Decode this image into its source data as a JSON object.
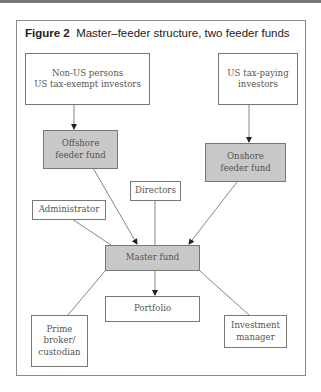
{
  "figure": {
    "label": "Figure 2",
    "title": "Master–feeder structure, two feeder funds"
  },
  "nodes": {
    "non_us": {
      "text": "Non-US persons\nUS tax-exempt investors",
      "shaded": false
    },
    "us_taxpaying": {
      "text": "US tax-paying\ninvestors",
      "shaded": false
    },
    "offshore": {
      "text": "Offshore\nfeeder fund",
      "shaded": true
    },
    "onshore": {
      "text": "Onshore\nfeeder fund",
      "shaded": true
    },
    "directors": {
      "text": "Directors",
      "shaded": false
    },
    "administrator": {
      "text": "Administrator",
      "shaded": false
    },
    "master": {
      "text": "Master fund",
      "shaded": true
    },
    "portfolio": {
      "text": "Portfolio",
      "shaded": false
    },
    "prime_broker": {
      "text": "Prime\nbroker/\ncustodian",
      "shaded": false
    },
    "investment_manager": {
      "text": "Investment\nmanager",
      "shaded": false
    }
  },
  "edges": [
    {
      "from": "non_us",
      "to": "offshore",
      "arrow": true
    },
    {
      "from": "us_taxpaying",
      "to": "onshore",
      "arrow": true
    },
    {
      "from": "offshore",
      "to": "master",
      "arrow": true
    },
    {
      "from": "onshore",
      "to": "master",
      "arrow": true
    },
    {
      "from": "directors",
      "to": "master",
      "arrow": false
    },
    {
      "from": "administrator",
      "to": "master",
      "arrow": false
    },
    {
      "from": "master",
      "to": "portfolio",
      "arrow": true
    },
    {
      "from": "master",
      "to": "prime_broker",
      "arrow": false
    },
    {
      "from": "master",
      "to": "investment_manager",
      "arrow": false
    }
  ],
  "colors": {
    "shaded_fill": "#c8c8c8",
    "border": "#777777",
    "text": "#555555"
  }
}
